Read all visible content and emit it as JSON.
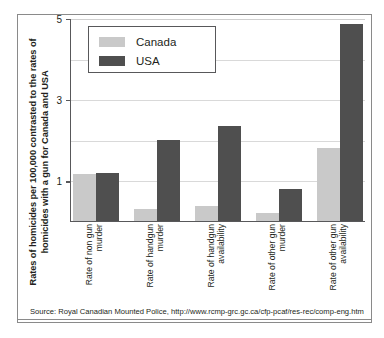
{
  "figure": {
    "source_note": "Source: Royal Canadian Mounted Police, http://www.rcmp-grc.gc.ca/cfp-pcaf/res-rec/comp-eng.htm",
    "y_axis_title": "Rates of homicides per 100,000 contrasted to the rates of homicides with a gun for Canada and USA"
  },
  "legend": {
    "canada_label": "Canada",
    "usa_label": "USA",
    "canada_color": "#c9c9c9",
    "usa_color": "#4f4f4f"
  },
  "axis": {
    "ticks": [
      {
        "value": 5,
        "label": "5"
      },
      {
        "value": 4,
        "label": ""
      },
      {
        "value": 3,
        "label": "3"
      },
      {
        "value": 2,
        "label": ""
      },
      {
        "value": 1,
        "label": "1"
      }
    ]
  },
  "chart_data": {
    "type": "bar",
    "title": "",
    "subtitle": "",
    "xlabel": "",
    "ylabel": "Rates of homicides per 100,000 contrasted to the rates of homicides with a gun for Canada and USA",
    "ylim": [
      0,
      5
    ],
    "yticks": [
      1,
      3,
      5
    ],
    "gridlines": [
      1,
      2,
      3,
      4,
      5
    ],
    "grid": true,
    "legend_position": "top-left-inside",
    "categories": [
      "Rate of non gun murder",
      "Rate of handgun murder",
      "Rate of handgun availability",
      "Rate of other gun murder",
      "Rate of other gun availability"
    ],
    "series": [
      {
        "name": "Canada",
        "color": "#c9c9c9",
        "values": [
          1.15,
          0.3,
          0.37,
          0.2,
          1.8
        ]
      },
      {
        "name": "USA",
        "color": "#4f4f4f",
        "values": [
          1.18,
          2.0,
          2.35,
          0.8,
          4.85
        ]
      }
    ],
    "annotations": [
      "Source: Royal Canadian Mounted Police, http://www.rcmp-grc.gc.ca/cfp-pcaf/res-rec/comp-eng.htm"
    ]
  }
}
